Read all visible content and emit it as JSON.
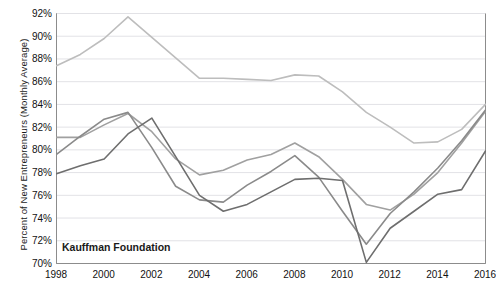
{
  "watermark": "Kauffman Foundation",
  "colors": {
    "series_light": "#bdbdbd",
    "series_mid": "#a0a0a0",
    "series_dark": "#8a8a8a",
    "series_darkest": "#6e6e6e",
    "grid": "#e2e2e6",
    "axis": "#8c8c8c",
    "text": "#111111"
  },
  "chart_data": {
    "type": "line",
    "title": "",
    "xlabel": "",
    "ylabel": "Percent of New Entrepreneurs (Monthly Average)",
    "xlim": [
      1998,
      2016
    ],
    "ylim": [
      70,
      92
    ],
    "ytick_labels": [
      "70%",
      "72%",
      "74%",
      "76%",
      "78%",
      "80%",
      "82%",
      "84%",
      "86%",
      "88%",
      "90%",
      "92%"
    ],
    "ytick_values": [
      70,
      72,
      74,
      76,
      78,
      80,
      82,
      84,
      86,
      88,
      90,
      92
    ],
    "xtick_labels": [
      "1998",
      "2000",
      "2002",
      "2004",
      "2006",
      "2008",
      "2010",
      "2012",
      "2014",
      "2016"
    ],
    "xtick_values": [
      1998,
      2000,
      2002,
      2004,
      2006,
      2008,
      2010,
      2012,
      2014,
      2016
    ],
    "x": [
      1998,
      1999,
      2000,
      2001,
      2002,
      2003,
      2004,
      2005,
      2006,
      2007,
      2008,
      2009,
      2010,
      2011,
      2012,
      2013,
      2014,
      2015,
      2016
    ],
    "grid": true,
    "legend": "none",
    "series": [
      {
        "name": "series-1",
        "color": "#bdbdbd",
        "values": [
          87.4,
          88.4,
          89.8,
          91.7,
          89.9,
          88.1,
          86.3,
          86.3,
          86.2,
          86.1,
          86.6,
          86.5,
          85.1,
          83.3,
          82.0,
          80.6,
          80.7,
          81.8,
          84.0
        ]
      },
      {
        "name": "series-2",
        "color": "#a0a0a0",
        "values": [
          81.1,
          81.1,
          82.2,
          83.2,
          81.6,
          79.2,
          77.8,
          78.2,
          79.1,
          79.6,
          80.6,
          79.4,
          77.4,
          75.2,
          74.7,
          76.1,
          78.0,
          80.6,
          83.4
        ]
      },
      {
        "name": "series-3",
        "color": "#8a8a8a",
        "values": [
          79.6,
          81.2,
          82.7,
          83.3,
          80.2,
          76.8,
          75.6,
          75.4,
          76.9,
          78.1,
          79.5,
          77.6,
          74.6,
          71.7,
          74.4,
          76.3,
          78.4,
          80.8,
          83.5
        ]
      },
      {
        "name": "series-4",
        "color": "#6e6e6e",
        "values": [
          77.9,
          78.6,
          79.2,
          81.4,
          82.8,
          79.4,
          76.0,
          74.6,
          75.2,
          76.3,
          77.4,
          77.5,
          77.3,
          70.1,
          73.1,
          74.6,
          76.1,
          76.5,
          79.9
        ]
      }
    ]
  }
}
